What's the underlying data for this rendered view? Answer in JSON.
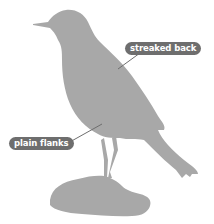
{
  "diagram": {
    "colors": {
      "silhouette": "#a8a8a8",
      "label_bg": "#6e6e6e",
      "label_text": "#ffffff",
      "leader_line": "#6e6e6e",
      "background": "#ffffff"
    },
    "labels": [
      {
        "id": "streaked-back",
        "text": "streaked back"
      },
      {
        "id": "plain-flanks",
        "text": "plain flanks"
      }
    ]
  }
}
